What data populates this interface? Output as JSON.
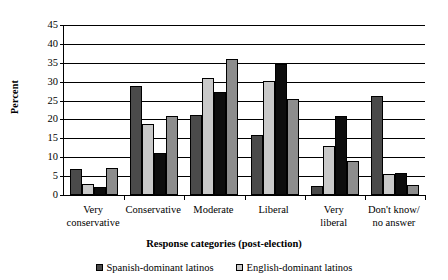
{
  "chart_data": {
    "type": "bar",
    "title": "",
    "xlabel": "Response categories (post-election)",
    "ylabel": "Percent",
    "ylim": [
      0,
      45
    ],
    "ytick_step": 5,
    "yticks": [
      0,
      5,
      10,
      15,
      20,
      25,
      30,
      35,
      40,
      45
    ],
    "grid": "horizontal",
    "legend_position": "bottom",
    "categories": [
      "Very conservative",
      "Conservative",
      "Moderate",
      "Liberal",
      "Very liberal",
      "Don't know/ no answer"
    ],
    "category_lines": [
      [
        "Very",
        "conservative"
      ],
      [
        "Conservative"
      ],
      [
        "Moderate"
      ],
      [
        "Liberal"
      ],
      [
        "Very",
        "liberal"
      ],
      [
        "Don't know/",
        "no answer"
      ]
    ],
    "series": [
      {
        "name": "Spanish-dominant latinos",
        "color": "#4a4a4a",
        "values": [
          7.0,
          28.9,
          21.1,
          15.8,
          2.4,
          26.2
        ]
      },
      {
        "name": "English-dominant latinos",
        "color": "#c9c9c9",
        "values": [
          2.9,
          18.9,
          31.0,
          30.3,
          13.0,
          5.5
        ]
      },
      {
        "name": "",
        "color": "#0d0d0d",
        "values": [
          2.0,
          11.1,
          27.3,
          34.7,
          21.0,
          5.7
        ]
      },
      {
        "name": "",
        "color": "#8d8d8d",
        "values": [
          7.2,
          20.8,
          36.0,
          25.4,
          9.0,
          2.7
        ]
      }
    ],
    "legend": [
      {
        "label": "Spanish-dominant latinos",
        "color": "#4a4a4a"
      },
      {
        "label": "English-dominant latinos",
        "color": "#c9c9c9"
      }
    ]
  }
}
